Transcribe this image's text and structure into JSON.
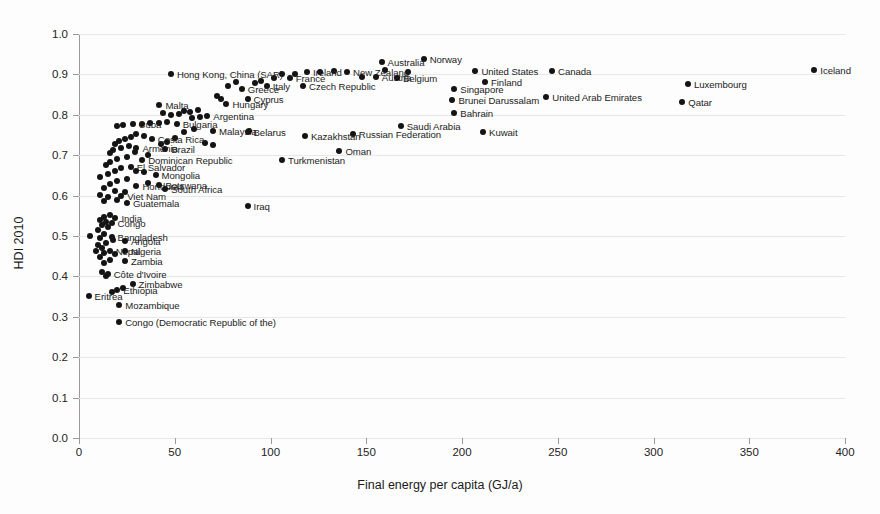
{
  "chart": {
    "type": "scatter",
    "title": "",
    "xlabel": "Final energy per capita (GJ/a)",
    "ylabel": "HDI 2010",
    "xlim": [
      0,
      400
    ],
    "ylim": [
      0.0,
      1.0
    ],
    "xticks": [
      "0",
      "50",
      "100",
      "150",
      "200",
      "250",
      "300",
      "350",
      "400"
    ],
    "yticks": [
      "0.0",
      "0.1",
      "0.2",
      "0.3",
      "0.4",
      "0.5",
      "0.6",
      "0.7",
      "0.8",
      "0.9",
      "1.0"
    ],
    "grid": "horizontal",
    "legend": "none",
    "marker_color": "#141414"
  },
  "chart_data": {
    "type": "scatter",
    "title": "",
    "xlabel": "Final energy per capita (GJ/a)",
    "ylabel": "HDI 2010",
    "xlim": [
      0,
      400
    ],
    "ylim": [
      0.0,
      1.0
    ],
    "grid": true,
    "legend_position": "none",
    "series": [
      {
        "name": "Countries",
        "points": [
          {
            "label": "Iceland",
            "x": 384,
            "y": 0.91,
            "side": "right"
          },
          {
            "label": "Norway",
            "x": 180,
            "y": 0.938,
            "side": "right"
          },
          {
            "label": "Canada",
            "x": 247,
            "y": 0.908,
            "side": "right"
          },
          {
            "label": "United States",
            "x": 207,
            "y": 0.908,
            "side": "right"
          },
          {
            "label": "Finland",
            "x": 212,
            "y": 0.88,
            "side": "right"
          },
          {
            "label": "Singapore",
            "x": 196,
            "y": 0.864,
            "side": "right"
          },
          {
            "label": "Luxembourg",
            "x": 318,
            "y": 0.876,
            "side": "right"
          },
          {
            "label": "Qatar",
            "x": 315,
            "y": 0.832,
            "side": "right"
          },
          {
            "label": "United Arab Emirates",
            "x": 244,
            "y": 0.843,
            "side": "right"
          },
          {
            "label": "Brunei Darussalam",
            "x": 195,
            "y": 0.837,
            "side": "right"
          },
          {
            "label": "Bahrain",
            "x": 196,
            "y": 0.805,
            "side": "right"
          },
          {
            "label": "Kuwait",
            "x": 211,
            "y": 0.757,
            "side": "right"
          },
          {
            "label": "Saudi Arabia",
            "x": 168,
            "y": 0.773,
            "side": "right"
          },
          {
            "label": "Russian Federation",
            "x": 143,
            "y": 0.753,
            "side": "right"
          },
          {
            "label": "Kazakhstan",
            "x": 118,
            "y": 0.748,
            "side": "right"
          },
          {
            "label": "Oman",
            "x": 136,
            "y": 0.71,
            "side": "right"
          },
          {
            "label": "Turkmenistan",
            "x": 106,
            "y": 0.688,
            "side": "right"
          },
          {
            "label": "Belarus",
            "x": 88,
            "y": 0.758,
            "side": "right"
          },
          {
            "label": "Iraq",
            "x": 88,
            "y": 0.574,
            "side": "right"
          },
          {
            "label": "Australia",
            "x": 158,
            "y": 0.93,
            "side": "right"
          },
          {
            "label": "New Zealand",
            "x": 140,
            "y": 0.906,
            "side": "right"
          },
          {
            "label": "Ireland",
            "x": 119,
            "y": 0.907,
            "side": "right"
          },
          {
            "label": "Austria",
            "x": 155,
            "y": 0.893,
            "side": "right"
          },
          {
            "label": "Belgium",
            "x": 166,
            "y": 0.892,
            "side": "right"
          },
          {
            "label": "France",
            "x": 110,
            "y": 0.891,
            "side": "right"
          },
          {
            "label": "Czech Republic",
            "x": 117,
            "y": 0.872,
            "side": "right"
          },
          {
            "label": "Italy",
            "x": 98,
            "y": 0.872,
            "side": "right"
          },
          {
            "label": "Greece",
            "x": 85,
            "y": 0.864,
            "side": "right"
          },
          {
            "label": "Hong Kong, China (SAR)",
            "x": 48,
            "y": 0.901,
            "side": "right"
          },
          {
            "label": "Cyprus",
            "x": 88,
            "y": 0.839,
            "side": "right"
          },
          {
            "label": "Hungary",
            "x": 77,
            "y": 0.827,
            "side": "right"
          },
          {
            "label": "Malta",
            "x": 42,
            "y": 0.825,
            "side": "right"
          },
          {
            "label": "Argentina",
            "x": 67,
            "y": 0.797,
            "side": "right"
          },
          {
            "label": "Bulgaria",
            "x": 51,
            "y": 0.778,
            "side": "right"
          },
          {
            "label": "Malaysia",
            "x": 70,
            "y": 0.76,
            "side": "right"
          },
          {
            "label": "Cuba",
            "x": 28,
            "y": 0.777,
            "side": "right"
          },
          {
            "label": "Costa Rica",
            "x": 38,
            "y": 0.739,
            "side": "right"
          },
          {
            "label": "Brazil",
            "x": 45,
            "y": 0.716,
            "side": "right"
          },
          {
            "label": "Armenia",
            "x": 30,
            "y": 0.717,
            "side": "right"
          },
          {
            "label": "Dominican Republic",
            "x": 33,
            "y": 0.687,
            "side": "right"
          },
          {
            "label": "El Salvador",
            "x": 27,
            "y": 0.672,
            "side": "right"
          },
          {
            "label": "Mongolia",
            "x": 40,
            "y": 0.652,
            "side": "right"
          },
          {
            "label": "Botswana",
            "x": 42,
            "y": 0.627,
            "side": "right"
          },
          {
            "label": "Honduras",
            "x": 30,
            "y": 0.623,
            "side": "right"
          },
          {
            "label": "South Africa",
            "x": 45,
            "y": 0.617,
            "side": "right"
          },
          {
            "label": "Viet Nam",
            "x": 22,
            "y": 0.598,
            "side": "right"
          },
          {
            "label": "Guatemala",
            "x": 25,
            "y": 0.582,
            "side": "right"
          },
          {
            "label": "India",
            "x": 19,
            "y": 0.545,
            "side": "right"
          },
          {
            "label": "Congo",
            "x": 17,
            "y": 0.531,
            "side": "right"
          },
          {
            "label": "Bangladesh",
            "x": 17,
            "y": 0.498,
            "side": "right"
          },
          {
            "label": "Angola",
            "x": 24,
            "y": 0.487,
            "side": "right"
          },
          {
            "label": "Nepal",
            "x": 16,
            "y": 0.462,
            "side": "right"
          },
          {
            "label": "Nigeria",
            "x": 24,
            "y": 0.462,
            "side": "right"
          },
          {
            "label": "Zambia",
            "x": 24,
            "y": 0.437,
            "side": "right"
          },
          {
            "label": "Côte d'Ivoire",
            "x": 15,
            "y": 0.406,
            "side": "right"
          },
          {
            "label": "Zimbabwe",
            "x": 28,
            "y": 0.38,
            "side": "right"
          },
          {
            "label": "Ethiopia",
            "x": 20,
            "y": 0.367,
            "side": "right"
          },
          {
            "label": "Eritrea",
            "x": 5,
            "y": 0.352,
            "side": "right"
          },
          {
            "label": "Mozambique",
            "x": 21,
            "y": 0.328,
            "side": "right"
          },
          {
            "label": "Congo (Democratic Republic of the)",
            "x": 21,
            "y": 0.288,
            "side": "right"
          }
        ],
        "unlabeled_points": [
          {
            "x": 160,
            "y": 0.912
          },
          {
            "x": 172,
            "y": 0.906
          },
          {
            "x": 133,
            "y": 0.908
          },
          {
            "x": 126,
            "y": 0.906
          },
          {
            "x": 148,
            "y": 0.893
          },
          {
            "x": 106,
            "y": 0.9
          },
          {
            "x": 113,
            "y": 0.901
          },
          {
            "x": 102,
            "y": 0.892
          },
          {
            "x": 95,
            "y": 0.884
          },
          {
            "x": 92,
            "y": 0.878
          },
          {
            "x": 82,
            "y": 0.88
          },
          {
            "x": 78,
            "y": 0.872
          },
          {
            "x": 72,
            "y": 0.846
          },
          {
            "x": 74,
            "y": 0.838
          },
          {
            "x": 62,
            "y": 0.812
          },
          {
            "x": 58,
            "y": 0.806
          },
          {
            "x": 55,
            "y": 0.81
          },
          {
            "x": 52,
            "y": 0.802
          },
          {
            "x": 48,
            "y": 0.8
          },
          {
            "x": 44,
            "y": 0.805
          },
          {
            "x": 63,
            "y": 0.795
          },
          {
            "x": 59,
            "y": 0.792
          },
          {
            "x": 46,
            "y": 0.782
          },
          {
            "x": 42,
            "y": 0.779
          },
          {
            "x": 37,
            "y": 0.78
          },
          {
            "x": 33,
            "y": 0.776
          },
          {
            "x": 23,
            "y": 0.775
          },
          {
            "x": 20,
            "y": 0.772
          },
          {
            "x": 60,
            "y": 0.765
          },
          {
            "x": 55,
            "y": 0.758
          },
          {
            "x": 50,
            "y": 0.742
          },
          {
            "x": 46,
            "y": 0.733
          },
          {
            "x": 43,
            "y": 0.728
          },
          {
            "x": 34,
            "y": 0.748
          },
          {
            "x": 30,
            "y": 0.752
          },
          {
            "x": 27,
            "y": 0.745
          },
          {
            "x": 24,
            "y": 0.74
          },
          {
            "x": 21,
            "y": 0.736
          },
          {
            "x": 19,
            "y": 0.728
          },
          {
            "x": 26,
            "y": 0.722
          },
          {
            "x": 22,
            "y": 0.718
          },
          {
            "x": 18,
            "y": 0.712
          },
          {
            "x": 16,
            "y": 0.705
          },
          {
            "x": 29,
            "y": 0.708
          },
          {
            "x": 36,
            "y": 0.7
          },
          {
            "x": 25,
            "y": 0.695
          },
          {
            "x": 20,
            "y": 0.69
          },
          {
            "x": 16,
            "y": 0.682
          },
          {
            "x": 14,
            "y": 0.675
          },
          {
            "x": 22,
            "y": 0.668
          },
          {
            "x": 30,
            "y": 0.662
          },
          {
            "x": 34,
            "y": 0.658
          },
          {
            "x": 19,
            "y": 0.66
          },
          {
            "x": 15,
            "y": 0.653
          },
          {
            "x": 11,
            "y": 0.645
          },
          {
            "x": 25,
            "y": 0.64
          },
          {
            "x": 20,
            "y": 0.635
          },
          {
            "x": 36,
            "y": 0.63
          },
          {
            "x": 16,
            "y": 0.628
          },
          {
            "x": 13,
            "y": 0.618
          },
          {
            "x": 19,
            "y": 0.612
          },
          {
            "x": 24,
            "y": 0.608
          },
          {
            "x": 11,
            "y": 0.602
          },
          {
            "x": 15,
            "y": 0.597
          },
          {
            "x": 20,
            "y": 0.589
          },
          {
            "x": 13,
            "y": 0.586
          },
          {
            "x": 16,
            "y": 0.552
          },
          {
            "x": 13,
            "y": 0.548
          },
          {
            "x": 11,
            "y": 0.54
          },
          {
            "x": 14,
            "y": 0.535
          },
          {
            "x": 12,
            "y": 0.528
          },
          {
            "x": 15,
            "y": 0.522
          },
          {
            "x": 10,
            "y": 0.515
          },
          {
            "x": 6,
            "y": 0.5
          },
          {
            "x": 13,
            "y": 0.505
          },
          {
            "x": 11,
            "y": 0.495
          },
          {
            "x": 18,
            "y": 0.49
          },
          {
            "x": 14,
            "y": 0.482
          },
          {
            "x": 10,
            "y": 0.478
          },
          {
            "x": 12,
            "y": 0.47
          },
          {
            "x": 9,
            "y": 0.462
          },
          {
            "x": 13,
            "y": 0.458
          },
          {
            "x": 19,
            "y": 0.455
          },
          {
            "x": 11,
            "y": 0.448
          },
          {
            "x": 16,
            "y": 0.44
          },
          {
            "x": 13,
            "y": 0.432
          },
          {
            "x": 12,
            "y": 0.412
          },
          {
            "x": 14,
            "y": 0.402
          },
          {
            "x": 23,
            "y": 0.372
          },
          {
            "x": 17,
            "y": 0.362
          },
          {
            "x": 89,
            "y": 0.76
          },
          {
            "x": 70,
            "y": 0.725
          },
          {
            "x": 66,
            "y": 0.73
          }
        ]
      }
    ]
  }
}
